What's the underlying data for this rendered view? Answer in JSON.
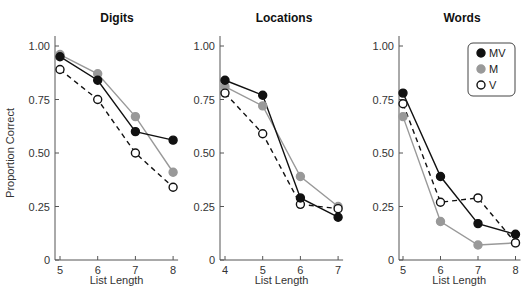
{
  "chart_data": [
    {
      "type": "line",
      "title": "Digits",
      "xlabel": "List Length",
      "ylabel": "Proportion Correct",
      "x": [
        5,
        6,
        7,
        8
      ],
      "ylim": [
        0,
        1.0
      ],
      "yticks": [
        "0",
        "0.25",
        "0.50",
        "0.75",
        "1.00"
      ],
      "series": [
        {
          "name": "MV",
          "values": [
            0.95,
            0.84,
            0.6,
            0.56
          ]
        },
        {
          "name": "M",
          "values": [
            0.96,
            0.87,
            0.67,
            0.41
          ]
        },
        {
          "name": "V",
          "values": [
            0.89,
            0.75,
            0.5,
            0.34
          ]
        }
      ],
      "grid": false
    },
    {
      "type": "line",
      "title": "Locations",
      "xlabel": "List Length",
      "ylabel": "",
      "x": [
        4,
        5,
        6,
        7
      ],
      "ylim": [
        0,
        1.0
      ],
      "yticks": [
        "0",
        "0.25",
        "0.50",
        "0.75",
        "1.00"
      ],
      "series": [
        {
          "name": "MV",
          "values": [
            0.84,
            0.77,
            0.29,
            0.2
          ]
        },
        {
          "name": "M",
          "values": [
            0.81,
            0.72,
            0.39,
            0.25
          ]
        },
        {
          "name": "V",
          "values": [
            0.78,
            0.59,
            0.26,
            0.24
          ]
        }
      ],
      "grid": false
    },
    {
      "type": "line",
      "title": "Words",
      "xlabel": "List Length",
      "ylabel": "",
      "x": [
        5,
        6,
        7,
        8
      ],
      "ylim": [
        0,
        1.0
      ],
      "yticks": [
        "0",
        "0.25",
        "0.50",
        "0.75",
        "1.00"
      ],
      "series": [
        {
          "name": "MV",
          "values": [
            0.78,
            0.39,
            0.17,
            0.12
          ]
        },
        {
          "name": "M",
          "values": [
            0.67,
            0.18,
            0.07,
            0.08
          ]
        },
        {
          "name": "V",
          "values": [
            0.73,
            0.27,
            0.29,
            0.08
          ]
        }
      ],
      "grid": false,
      "legend_position": "upper right"
    }
  ],
  "legend": [
    {
      "label": "MV",
      "marker": "filled-black",
      "line": "solid"
    },
    {
      "label": "M",
      "marker": "filled-gray",
      "line": "solid-gray"
    },
    {
      "label": "V",
      "marker": "open-circle",
      "line": "dashed"
    }
  ],
  "colors": {
    "MV": "#111111",
    "M": "#999999",
    "V": "#111111",
    "axis": "#555555"
  }
}
